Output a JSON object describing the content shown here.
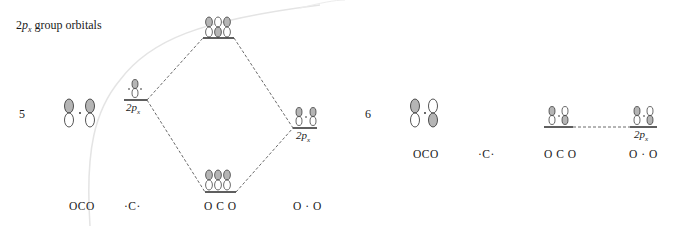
{
  "title": {
    "prefix": "2",
    "italic": "p",
    "subscript": "x",
    "suffix": " group orbitals"
  },
  "rows": [
    {
      "number": "5",
      "group_orbital_label": "OCO",
      "carbon_label": "·C·",
      "carbon_ao_label": "2p",
      "carbon_ao_subscript": "x",
      "oxygen_ao_label": "2p",
      "oxygen_ao_subscript": "x",
      "mo_label": "O C O",
      "oxygen_label": "O · O",
      "levels": {
        "antibonding": "top lobes shaded: +, −, +",
        "bonding": "top lobes shaded: +, +, +"
      }
    },
    {
      "number": "6",
      "group_orbital_label": "OCO",
      "carbon_label": "·C·",
      "mo_label": "O C O",
      "oxygen_label": "O · O",
      "oxygen_ao_label": "2p",
      "oxygen_ao_subscript": "x",
      "levels": {
        "nonbonding": "left top shaded, right bottom shaded"
      }
    }
  ],
  "colors": {
    "lobe_shaded": "#b5b5b5",
    "lobe_outline": "#2a2a2a",
    "line": "#1a1a1a",
    "dashed": "#444444",
    "watermark_curve": "#e2e2e2"
  }
}
